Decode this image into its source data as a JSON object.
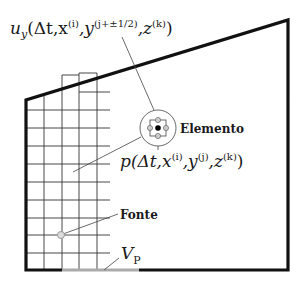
{
  "diagram": {
    "type": "finite-difference grid over domain",
    "colors": {
      "boundary": "#111111",
      "grid": "#333333",
      "leader": "#444444",
      "vp_segment": "#aaaaaa",
      "source": "#999999",
      "node_gray": "#aaaaaa",
      "node_black": "#000000"
    },
    "labels": {
      "uy_main": "u",
      "uy_sub": "y",
      "uy_open": "(Δt,x",
      "uy_sup_i": "(i)",
      "uy_mid": ",y",
      "uy_sup_j": "(j+±1/2)",
      "uy_mid2": ",z",
      "uy_sup_k": "(k)",
      "uy_close": ")",
      "p_main": "p(Δt,x",
      "p_sup_i": "(i)",
      "p_mid": ",y",
      "p_sup_j": "(j)",
      "p_mid2": ",z",
      "p_sup_k": "(k)",
      "p_close": ")",
      "elemento": "Elemento",
      "fonte": "Fonte",
      "vp_main": "V",
      "vp_sub": "P"
    }
  }
}
